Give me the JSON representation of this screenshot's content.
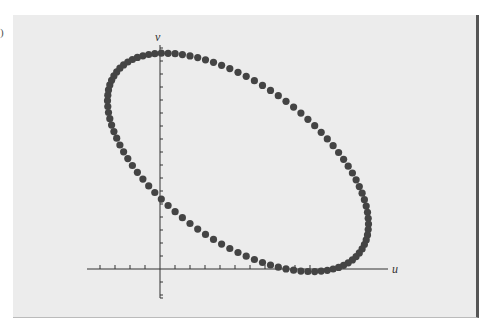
{
  "panel_label": ")",
  "chart_data": {
    "type": "scatter",
    "title": "",
    "xlabel": "u",
    "ylabel": "v",
    "grid": false,
    "legend": null,
    "axis_units": {
      "x_ticks_left": 4,
      "x_ticks_right": 10,
      "y_ticks_up": 17,
      "y_ticks_down": 2
    },
    "ellipse": {
      "center_u": 5.2,
      "center_v": 8.2,
      "semi_u": 8.7,
      "semi_v": 8.4,
      "phase": 0.6
    },
    "xlim": [
      -5,
      15
    ],
    "ylim": [
      -2,
      17.5
    ],
    "n_points": 100,
    "dot_color": "#444444"
  },
  "colors": {
    "panel": "#ececec",
    "axis": "#333333",
    "border": "#555555"
  }
}
